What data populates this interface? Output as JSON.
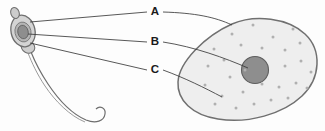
{
  "diagram": {
    "background_color": "#fdfdfd",
    "labels": [
      {
        "id": "A",
        "text": "A",
        "x": 155,
        "y": 12
      },
      {
        "id": "B",
        "text": "B",
        "x": 155,
        "y": 42
      },
      {
        "id": "C",
        "text": "C",
        "x": 155,
        "y": 70
      }
    ],
    "leader_lines": [
      {
        "name": "leader-line-a-left",
        "from_label": "A",
        "path": "M 147 12 L 30 22",
        "points_to": "sperm-acrosome"
      },
      {
        "name": "leader-line-a-right",
        "from_label": "A",
        "path": "M 163 12 C 195 13 215 17 232 25",
        "points_to": "egg-membrane"
      },
      {
        "name": "leader-line-b-left",
        "from_label": "B",
        "path": "M 147 42 L 28 34",
        "points_to": "sperm-nucleus"
      },
      {
        "name": "leader-line-b-right",
        "from_label": "B",
        "path": "M 163 42 C 195 47 225 58 248 68",
        "points_to": "egg-nucleus"
      },
      {
        "name": "leader-line-c-left",
        "from_label": "C",
        "path": "M 147 70 L 30 43",
        "points_to": "sperm-midpiece"
      },
      {
        "name": "leader-line-c-right",
        "from_label": "C",
        "path": "M 163 70 C 185 78 205 88 222 97",
        "points_to": "egg-cytoplasm"
      }
    ],
    "sperm": {
      "name": "sperm-cell",
      "head_fill": "#cfcfcf",
      "head_stroke": "#707070",
      "nucleus_fill": "#8e8e8e",
      "nucleus_stroke": "#646464",
      "tail_stroke": "#6e6e6e",
      "acrosome_cap": true
    },
    "egg": {
      "name": "egg-cell",
      "body_fill": "#eeeeee",
      "body_stroke": "#707070",
      "nucleus_fill": "#8e8e8e",
      "nucleus_stroke": "#5e5e5e",
      "granule_fill": "#b8b8b8",
      "granule_count": 28,
      "granules": [
        [
          232,
          34
        ],
        [
          253,
          25
        ],
        [
          273,
          37
        ],
        [
          293,
          29
        ],
        [
          214,
          49
        ],
        [
          241,
          45
        ],
        [
          262,
          48
        ],
        [
          285,
          50
        ],
        [
          300,
          43
        ],
        [
          208,
          66
        ],
        [
          224,
          60
        ],
        [
          230,
          77
        ],
        [
          285,
          66
        ],
        [
          301,
          61
        ],
        [
          311,
          72
        ],
        [
          243,
          92
        ],
        [
          262,
          84
        ],
        [
          279,
          87
        ],
        [
          296,
          83
        ],
        [
          205,
          85
        ],
        [
          222,
          96
        ],
        [
          254,
          104
        ],
        [
          271,
          100
        ],
        [
          288,
          98
        ],
        [
          236,
          108
        ],
        [
          215,
          104
        ],
        [
          307,
          88
        ],
        [
          245,
          70
        ]
      ]
    }
  }
}
